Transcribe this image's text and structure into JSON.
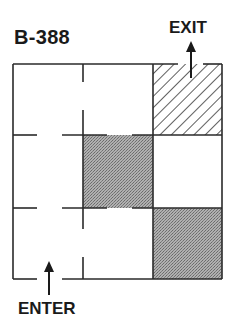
{
  "diagram": {
    "title": "B-388",
    "exit_label": "EXIT",
    "enter_label": "ENTER",
    "grid": {
      "rows": 3,
      "cols": 3
    },
    "cells": [
      {
        "row": 0,
        "col": 0,
        "fill": "white"
      },
      {
        "row": 0,
        "col": 1,
        "fill": "white"
      },
      {
        "row": 0,
        "col": 2,
        "fill": "hatched"
      },
      {
        "row": 1,
        "col": 0,
        "fill": "white"
      },
      {
        "row": 1,
        "col": 1,
        "fill": "gray-stipple"
      },
      {
        "row": 1,
        "col": 2,
        "fill": "white"
      },
      {
        "row": 2,
        "col": 0,
        "fill": "white"
      },
      {
        "row": 2,
        "col": 1,
        "fill": "white"
      },
      {
        "row": 2,
        "col": 2,
        "fill": "gray-stipple"
      }
    ],
    "colors": {
      "line": "#2a2a2a",
      "gray_fill": "#9a9a9a",
      "hatch": "#1a1a1a",
      "background": "#ffffff"
    }
  }
}
